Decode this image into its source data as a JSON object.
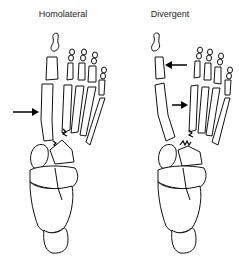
{
  "figure": {
    "panels": [
      {
        "title": "Homolateral",
        "arrows": 1
      },
      {
        "title": "Divergent",
        "arrows": 2
      }
    ]
  }
}
